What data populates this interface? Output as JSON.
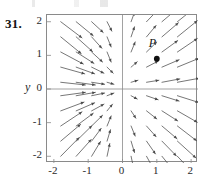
{
  "figure": {
    "problem_number": "31.",
    "point_label": "P",
    "y_axis_label": "y",
    "x_axis_label": "",
    "axis_color": "#8a8a8a",
    "arrow_color": "#4a4a4a",
    "point_color": "#111111",
    "text_color": "#2a2a2a"
  },
  "chart_data": {
    "type": "scatter",
    "title": "",
    "subtitle": "",
    "xlabel": "",
    "ylabel": "y",
    "xlim": [
      -2.2,
      2.2
    ],
    "ylim": [
      -2.2,
      2.2
    ],
    "xticks": [
      -2,
      -1,
      0,
      1,
      2
    ],
    "yticks": [
      -2,
      -1,
      0,
      1,
      2
    ],
    "xtick_labels": [
      "-2",
      "-1",
      "0",
      "1",
      "2"
    ],
    "ytick_labels": [
      "2",
      "1",
      "0",
      "-1",
      "-2"
    ],
    "grid": false,
    "legend": null,
    "annotations": [
      {
        "label": "P",
        "x": 1.0,
        "y": 0.9,
        "marker": "filled-circle",
        "label_offset": [
          -0.12,
          0.42
        ]
      }
    ],
    "vector_field": {
      "description": "direction field; arrows scaled by local magnitude",
      "grid_x": [
        -1.8,
        -1.35,
        -0.9,
        -0.45,
        0.25,
        0.7,
        1.15,
        1.6,
        2.0
      ],
      "grid_y": [
        2.0,
        1.55,
        1.1,
        0.65,
        0.2,
        -0.2,
        -0.65,
        -1.1,
        -1.55,
        -2.0
      ],
      "arrows": [
        {
          "x": -1.8,
          "y": 2.0,
          "dx": 0.62,
          "dy": -0.48
        },
        {
          "x": -1.35,
          "y": 2.0,
          "dx": 0.5,
          "dy": -0.42
        },
        {
          "x": -0.9,
          "y": 2.0,
          "dx": 0.34,
          "dy": -0.32
        },
        {
          "x": -0.45,
          "y": 2.0,
          "dx": 0.14,
          "dy": -0.28
        },
        {
          "x": 0.25,
          "y": 2.0,
          "dx": 0.1,
          "dy": 0.28
        },
        {
          "x": 0.7,
          "y": 2.0,
          "dx": 0.3,
          "dy": 0.32
        },
        {
          "x": 1.15,
          "y": 2.0,
          "dx": 0.46,
          "dy": 0.4
        },
        {
          "x": 1.6,
          "y": 2.0,
          "dx": 0.56,
          "dy": 0.46
        },
        {
          "x": -1.8,
          "y": 1.55,
          "dx": 0.6,
          "dy": -0.5
        },
        {
          "x": -1.35,
          "y": 1.55,
          "dx": 0.48,
          "dy": -0.44
        },
        {
          "x": -0.9,
          "y": 1.55,
          "dx": 0.3,
          "dy": -0.34
        },
        {
          "x": -0.45,
          "y": 1.55,
          "dx": 0.12,
          "dy": -0.3
        },
        {
          "x": 0.25,
          "y": 1.55,
          "dx": 0.1,
          "dy": 0.3
        },
        {
          "x": 0.7,
          "y": 1.55,
          "dx": 0.28,
          "dy": 0.34
        },
        {
          "x": 1.15,
          "y": 1.55,
          "dx": 0.48,
          "dy": 0.42
        },
        {
          "x": 1.6,
          "y": 1.55,
          "dx": 0.58,
          "dy": 0.48
        },
        {
          "x": -1.8,
          "y": 1.1,
          "dx": 0.66,
          "dy": -0.36
        },
        {
          "x": -1.35,
          "y": 1.1,
          "dx": 0.52,
          "dy": -0.34
        },
        {
          "x": -0.9,
          "y": 1.1,
          "dx": 0.32,
          "dy": -0.3
        },
        {
          "x": -0.45,
          "y": 1.1,
          "dx": 0.12,
          "dy": -0.3
        },
        {
          "x": 0.25,
          "y": 1.1,
          "dx": 0.12,
          "dy": 0.3
        },
        {
          "x": 0.7,
          "y": 1.1,
          "dx": 0.3,
          "dy": 0.3
        },
        {
          "x": 1.15,
          "y": 1.1,
          "dx": 0.46,
          "dy": 0.34
        },
        {
          "x": 1.6,
          "y": 1.1,
          "dx": 0.58,
          "dy": 0.4
        },
        {
          "x": -1.8,
          "y": 0.65,
          "dx": 0.7,
          "dy": -0.2
        },
        {
          "x": -1.35,
          "y": 0.65,
          "dx": 0.54,
          "dy": -0.2
        },
        {
          "x": -0.9,
          "y": 0.65,
          "dx": 0.36,
          "dy": -0.18
        },
        {
          "x": -0.45,
          "y": 0.65,
          "dx": 0.18,
          "dy": -0.18
        },
        {
          "x": 0.25,
          "y": 0.65,
          "dx": 0.18,
          "dy": 0.16
        },
        {
          "x": 0.7,
          "y": 0.65,
          "dx": 0.34,
          "dy": 0.18
        },
        {
          "x": 1.15,
          "y": 0.65,
          "dx": 0.5,
          "dy": 0.22
        },
        {
          "x": 1.6,
          "y": 0.65,
          "dx": 0.62,
          "dy": 0.26
        },
        {
          "x": -1.8,
          "y": 0.2,
          "dx": 0.72,
          "dy": -0.08
        },
        {
          "x": -1.35,
          "y": 0.2,
          "dx": 0.56,
          "dy": -0.08
        },
        {
          "x": -0.9,
          "y": 0.2,
          "dx": 0.38,
          "dy": -0.06
        },
        {
          "x": -0.45,
          "y": 0.2,
          "dx": 0.2,
          "dy": -0.06
        },
        {
          "x": 0.25,
          "y": 0.2,
          "dx": 0.2,
          "dy": 0.06
        },
        {
          "x": 0.7,
          "y": 0.2,
          "dx": 0.36,
          "dy": 0.06
        },
        {
          "x": 1.15,
          "y": 0.2,
          "dx": 0.52,
          "dy": 0.1
        },
        {
          "x": 1.6,
          "y": 0.2,
          "dx": 0.64,
          "dy": 0.12
        },
        {
          "x": -1.8,
          "y": -0.2,
          "dx": 0.72,
          "dy": 0.1
        },
        {
          "x": -1.35,
          "y": -0.2,
          "dx": 0.56,
          "dy": 0.1
        },
        {
          "x": -0.9,
          "y": -0.2,
          "dx": 0.38,
          "dy": 0.08
        },
        {
          "x": -0.45,
          "y": -0.2,
          "dx": 0.2,
          "dy": 0.08
        },
        {
          "x": 0.25,
          "y": -0.2,
          "dx": 0.18,
          "dy": -0.1
        },
        {
          "x": 0.7,
          "y": -0.2,
          "dx": 0.34,
          "dy": -0.12
        },
        {
          "x": 1.15,
          "y": -0.2,
          "dx": 0.5,
          "dy": -0.16
        },
        {
          "x": 1.6,
          "y": -0.2,
          "dx": 0.62,
          "dy": -0.2
        },
        {
          "x": -1.8,
          "y": -0.65,
          "dx": 0.68,
          "dy": 0.26
        },
        {
          "x": -1.35,
          "y": -0.65,
          "dx": 0.54,
          "dy": 0.24
        },
        {
          "x": -0.9,
          "y": -0.65,
          "dx": 0.36,
          "dy": 0.2
        },
        {
          "x": -0.45,
          "y": -0.65,
          "dx": 0.16,
          "dy": 0.2
        },
        {
          "x": 0.25,
          "y": -0.65,
          "dx": 0.14,
          "dy": -0.22
        },
        {
          "x": 0.7,
          "y": -0.65,
          "dx": 0.3,
          "dy": -0.24
        },
        {
          "x": 1.15,
          "y": -0.65,
          "dx": 0.46,
          "dy": -0.3
        },
        {
          "x": 1.6,
          "y": -0.65,
          "dx": 0.58,
          "dy": -0.34
        },
        {
          "x": -1.8,
          "y": -1.1,
          "dx": 0.62,
          "dy": 0.42
        },
        {
          "x": -1.35,
          "y": -1.1,
          "dx": 0.5,
          "dy": 0.38
        },
        {
          "x": -0.9,
          "y": -1.1,
          "dx": 0.32,
          "dy": 0.32
        },
        {
          "x": -0.45,
          "y": -1.1,
          "dx": 0.12,
          "dy": 0.3
        },
        {
          "x": 0.25,
          "y": -1.1,
          "dx": 0.12,
          "dy": -0.3
        },
        {
          "x": 0.7,
          "y": -1.1,
          "dx": 0.28,
          "dy": -0.32
        },
        {
          "x": 1.15,
          "y": -1.1,
          "dx": 0.44,
          "dy": -0.38
        },
        {
          "x": 1.6,
          "y": -1.1,
          "dx": 0.56,
          "dy": -0.44
        },
        {
          "x": -1.8,
          "y": -1.55,
          "dx": 0.58,
          "dy": 0.5
        },
        {
          "x": -1.35,
          "y": -1.55,
          "dx": 0.46,
          "dy": 0.46
        },
        {
          "x": -0.9,
          "y": -1.55,
          "dx": 0.28,
          "dy": 0.38
        },
        {
          "x": -0.45,
          "y": -1.55,
          "dx": 0.1,
          "dy": 0.34
        },
        {
          "x": 0.25,
          "y": -1.55,
          "dx": 0.1,
          "dy": -0.34
        },
        {
          "x": 0.7,
          "y": -1.55,
          "dx": 0.26,
          "dy": -0.38
        },
        {
          "x": 1.15,
          "y": -1.55,
          "dx": 0.42,
          "dy": -0.44
        },
        {
          "x": 1.6,
          "y": -1.55,
          "dx": 0.54,
          "dy": -0.5
        },
        {
          "x": -1.8,
          "y": -2.0,
          "dx": 0.54,
          "dy": 0.56
        },
        {
          "x": -1.35,
          "y": -2.0,
          "dx": 0.44,
          "dy": 0.5
        },
        {
          "x": -0.9,
          "y": -2.0,
          "dx": 0.26,
          "dy": 0.44
        },
        {
          "x": -0.45,
          "y": -2.0,
          "dx": 0.08,
          "dy": 0.38
        },
        {
          "x": 0.25,
          "y": -2.0,
          "dx": 0.08,
          "dy": -0.38
        },
        {
          "x": 0.7,
          "y": -2.0,
          "dx": 0.24,
          "dy": -0.44
        },
        {
          "x": 1.15,
          "y": -2.0,
          "dx": 0.4,
          "dy": -0.5
        },
        {
          "x": 1.6,
          "y": -2.0,
          "dx": 0.52,
          "dy": -0.56
        }
      ]
    }
  }
}
